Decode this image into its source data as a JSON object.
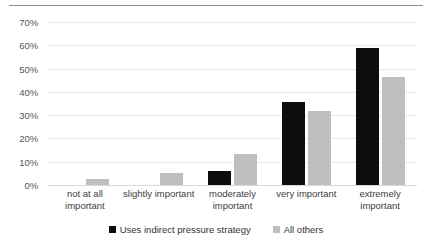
{
  "chart_data": {
    "type": "bar",
    "title": "",
    "subtitle": "",
    "xlabel": "",
    "ylabel": "",
    "ylim": [
      0,
      70
    ],
    "ytick_step": 10,
    "ytick_labels": [
      "70%",
      "60%",
      "50%",
      "40%",
      "30%",
      "20%",
      "10%",
      "0%"
    ],
    "ytick_values": [
      70,
      60,
      50,
      40,
      30,
      20,
      10,
      0
    ],
    "grid": true,
    "legend_position": "bottom",
    "categories": [
      "not at all important",
      "slightly important",
      "moderately important",
      "very important",
      "extremely important"
    ],
    "series": [
      {
        "name": "Uses indirect pressure strategy",
        "color": "#0d0d0d",
        "values": [
          0,
          0,
          6.0,
          35.5,
          58.8
        ]
      },
      {
        "name": "All others",
        "color": "#bfbfbf",
        "values": [
          2.5,
          5.0,
          13.5,
          32.0,
          46.5
        ]
      }
    ]
  },
  "legend": {
    "items": [
      {
        "label": "Uses indirect pressure strategy",
        "swatch": "legend-swatch-black"
      },
      {
        "label": "All others",
        "swatch": "legend-swatch-gray"
      }
    ]
  },
  "colors": {
    "series_black": "#0d0d0d",
    "series_gray": "#bfbfbf",
    "gridline": "#e8e8e8",
    "top_rule": "#8c8c8c",
    "text": "#404040"
  }
}
